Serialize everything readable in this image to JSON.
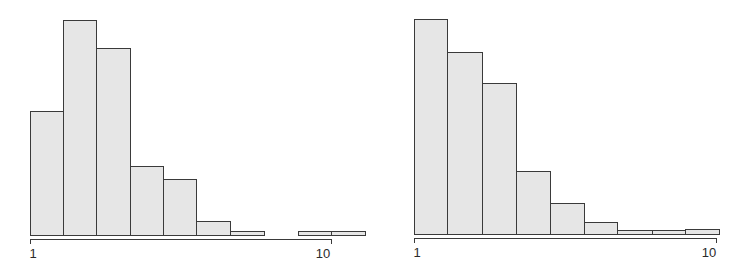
{
  "chart_data": [
    {
      "type": "bar",
      "subtype": "histogram",
      "title": "",
      "xlabel": "",
      "ylabel": "",
      "x_scale": "log",
      "x_ticks": [
        "1",
        "10"
      ],
      "grid": false,
      "legend": null,
      "bin_edges_px": [
        30,
        63,
        96,
        130,
        163,
        196,
        230,
        264,
        298,
        331,
        365
      ],
      "values": [
        124,
        215,
        187,
        69,
        56,
        14,
        4,
        0,
        4,
        4
      ],
      "value_units": "relative bar height (px, max ≈ 215)",
      "bar_color": "#e6e6e6",
      "edge_color": "#3a3a3a"
    },
    {
      "type": "bar",
      "subtype": "histogram",
      "title": "",
      "xlabel": "",
      "ylabel": "",
      "x_scale": "log",
      "x_ticks": [
        "1",
        "10"
      ],
      "grid": false,
      "legend": null,
      "bin_edges_px": [
        414,
        447,
        482,
        516,
        550,
        584,
        617,
        652,
        685,
        719
      ],
      "values": [
        215,
        182,
        151,
        63,
        31,
        12,
        4,
        4,
        5
      ],
      "value_units": "relative bar height (px, max ≈ 215)",
      "bar_color": "#e6e6e6",
      "edge_color": "#3a3a3a"
    }
  ],
  "left": {
    "baseline": 235,
    "axis": {
      "y": 239,
      "x0": 30,
      "x1": 331
    },
    "tick_labels": [
      {
        "text": "1",
        "x": 33
      },
      {
        "text": "10",
        "x": 323
      }
    ]
  },
  "right": {
    "baseline": 234,
    "axis": {
      "y": 238,
      "x0": 414,
      "x1": 716
    },
    "tick_labels": [
      {
        "text": "1",
        "x": 417
      },
      {
        "text": "10",
        "x": 709
      }
    ]
  }
}
